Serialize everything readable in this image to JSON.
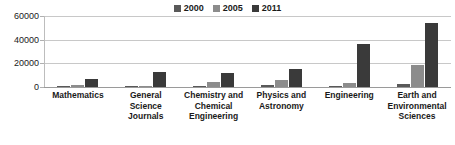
{
  "chart_data": {
    "type": "bar",
    "title": "",
    "subtitle": "",
    "xlabel": "",
    "ylabel": "",
    "ylim": [
      0,
      60000
    ],
    "ytick_labels": [
      "60000",
      "40000",
      "20000",
      "0"
    ],
    "ytick_values": [
      60000,
      40000,
      20000,
      0
    ],
    "grid": true,
    "legend_position": "top-center",
    "categories": [
      "Mathematics",
      "General Science Journals",
      "Chemistry and Chemical Engineering",
      "Physics and Astronomy",
      "Engineering",
      "Earth and Environmental Sciences"
    ],
    "series": [
      {
        "name": "2000",
        "color": "#595959",
        "values": [
          900,
          400,
          1200,
          1900,
          300,
          2600
        ]
      },
      {
        "name": "2005",
        "color": "#8c8c8c",
        "values": [
          2100,
          500,
          4300,
          6300,
          3800,
          18500
        ]
      },
      {
        "name": "2011",
        "color": "#3a3a3a",
        "values": [
          6800,
          12300,
          12200,
          15200,
          36600,
          54000
        ]
      }
    ]
  },
  "legend": {
    "items": [
      {
        "label": "2000",
        "color": "#595959"
      },
      {
        "label": "2005",
        "color": "#8c8c8c"
      },
      {
        "label": "2011",
        "color": "#3a3a3a"
      }
    ]
  },
  "colors": {
    "background": "#ffffff",
    "gridline": "#c8c8c8",
    "axis": "#9a9a9a",
    "text": "#1a1a1a"
  }
}
